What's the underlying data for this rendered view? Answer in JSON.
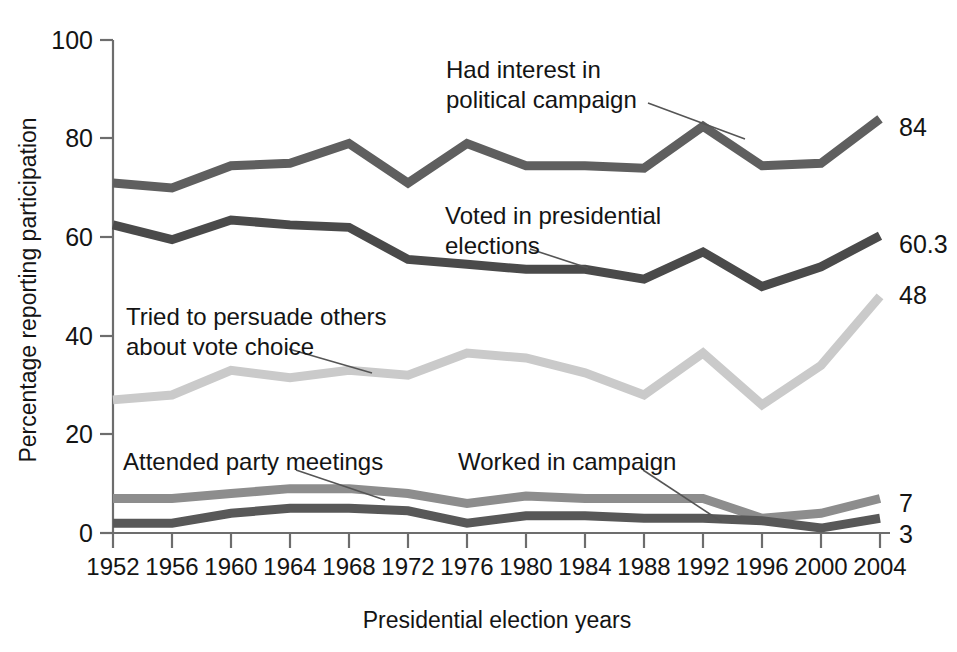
{
  "chart_data": {
    "type": "line",
    "title": "",
    "xlabel": "Presidential election years",
    "ylabel": "Percentage reporting participation",
    "categories": [
      1952,
      1956,
      1960,
      1964,
      1968,
      1972,
      1976,
      1980,
      1984,
      1988,
      1992,
      1996,
      2000,
      2004
    ],
    "xtick_labels": [
      "1952",
      "1956",
      "1960",
      "1964",
      "1968",
      "1972",
      "1976",
      "1980",
      "1984",
      "1988",
      "1992",
      "1996",
      "2000",
      "2004"
    ],
    "ytick_labels": [
      "0",
      "20",
      "40",
      "60",
      "80",
      "100"
    ],
    "yticks": [
      0,
      20,
      40,
      60,
      80,
      100
    ],
    "ylim": [
      0,
      100
    ],
    "xlim": [
      1952,
      2004
    ],
    "grid": false,
    "legend": "annotations-inline",
    "series": [
      {
        "name": "Had interest in political campaign",
        "color": "#5f5f5f",
        "end_label": "84",
        "values": [
          71,
          70,
          74.5,
          75,
          79,
          71,
          79,
          74.5,
          74.5,
          74,
          82.5,
          74.5,
          75,
          84
        ]
      },
      {
        "name": "Voted in presidential elections",
        "color": "#4a4a4a",
        "end_label": "60.3",
        "values": [
          62.5,
          59.5,
          63.5,
          62.5,
          62,
          55.5,
          54.5,
          53.5,
          53.5,
          51.5,
          57,
          50,
          54,
          60.3
        ]
      },
      {
        "name": "Tried to persuade others about vote choice",
        "color": "#cacaca",
        "end_label": "48",
        "values": [
          27,
          28,
          33,
          31.5,
          33,
          32,
          36.5,
          35.5,
          32.5,
          28,
          36.5,
          26,
          34,
          48
        ]
      },
      {
        "name": "Attended party meetings",
        "color": "#8d8d8d",
        "end_label": "7",
        "values": [
          7,
          7,
          8,
          9,
          9,
          8,
          6,
          7.5,
          7,
          7,
          7,
          3,
          4,
          7
        ]
      },
      {
        "name": "Worked in campaign",
        "color": "#585858",
        "end_label": "3",
        "values": [
          2,
          2,
          4,
          5,
          5,
          4.5,
          2,
          3.5,
          3.5,
          3,
          3,
          2.5,
          1,
          3
        ]
      }
    ],
    "annotations": [
      {
        "id": "had-interest",
        "text_lines": [
          "Had interest in",
          "political campaign"
        ]
      },
      {
        "id": "voted",
        "text_lines": [
          "Voted in presidential",
          "elections"
        ]
      },
      {
        "id": "persuade",
        "text_lines": [
          "Tried to persuade others",
          "about vote choice"
        ]
      },
      {
        "id": "attended",
        "text_lines": [
          "Attended party meetings"
        ]
      },
      {
        "id": "worked",
        "text_lines": [
          "Worked in campaign"
        ]
      }
    ]
  },
  "axis": {
    "y_title": "Percentage reporting participation",
    "x_title": "Presidential election years",
    "y_ticks": {
      "t0": "0",
      "t20": "20",
      "t40": "40",
      "t60": "60",
      "t80": "80",
      "t100": "100"
    },
    "x_ticks": {
      "y1952": "1952",
      "y1956": "1956",
      "y1960": "1960",
      "y1964": "1964",
      "y1968": "1968",
      "y1972": "1972",
      "y1976": "1976",
      "y1980": "1980",
      "y1984": "1984",
      "y1988": "1988",
      "y1992": "1992",
      "y1996": "1996",
      "y2000": "2000",
      "y2004": "2004"
    }
  },
  "annotations": {
    "had_interest_l1": "Had interest in",
    "had_interest_l2": "political campaign",
    "voted_l1": "Voted in presidential",
    "voted_l2": "elections",
    "persuade_l1": "Tried to persuade others",
    "persuade_l2": "about vote choice",
    "attended": "Attended party meetings",
    "worked": "Worked in campaign"
  },
  "end_labels": {
    "had_interest": "84",
    "voted": "60.3",
    "persuade": "48",
    "attended": "7",
    "worked": "3"
  }
}
